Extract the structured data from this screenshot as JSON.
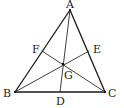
{
  "diagram": {
    "type": "geometry",
    "colors": {
      "stroke": "#1a1a1a",
      "text": "#222222",
      "background": "#ffffff"
    },
    "points": {
      "A": {
        "label": "A",
        "x": 70,
        "y": 10
      },
      "B": {
        "label": "B",
        "x": 15,
        "y": 92
      },
      "C": {
        "label": "C",
        "x": 105,
        "y": 92
      },
      "D": {
        "label": "D",
        "x": 60,
        "y": 92
      },
      "E": {
        "label": "E",
        "x": 89,
        "y": 51
      },
      "F": {
        "label": "F",
        "x": 42,
        "y": 51
      },
      "G": {
        "label": "G",
        "x": 63,
        "y": 64
      }
    },
    "segments": [
      {
        "from": "A",
        "to": "B",
        "kind": "side"
      },
      {
        "from": "B",
        "to": "C",
        "kind": "side"
      },
      {
        "from": "C",
        "to": "A",
        "kind": "side"
      },
      {
        "from": "A",
        "to": "D",
        "kind": "cevian"
      },
      {
        "from": "B",
        "to": "E",
        "kind": "cevian"
      },
      {
        "from": "C",
        "to": "F",
        "kind": "cevian"
      }
    ],
    "labels": {
      "A": {
        "text": "A",
        "x": 66,
        "y": 8
      },
      "B": {
        "text": "B",
        "x": 3,
        "y": 97
      },
      "C": {
        "text": "C",
        "x": 108,
        "y": 97
      },
      "D": {
        "text": "D",
        "x": 56,
        "y": 105
      },
      "E": {
        "text": "E",
        "x": 93,
        "y": 53
      },
      "F": {
        "text": "F",
        "x": 32,
        "y": 53
      },
      "G": {
        "text": "G",
        "x": 64,
        "y": 79
      }
    }
  }
}
